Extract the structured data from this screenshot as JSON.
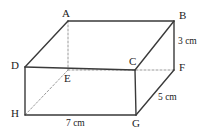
{
  "figure": {
    "name": "cuboid-diagram",
    "type": "geometry-solid",
    "solid": "cuboid",
    "background_color": "#ffffff",
    "edge_color": "#3a3a3a",
    "hidden_edge_color": "#9a9a9a",
    "label_color": "#222222",
    "vertices": [
      {
        "id": "A",
        "label": "A",
        "x": 68,
        "y": 21,
        "label_x": 62,
        "label_y": 8,
        "hidden": false
      },
      {
        "id": "B",
        "label": "B",
        "x": 174,
        "y": 21,
        "label_x": 179,
        "label_y": 10,
        "hidden": false
      },
      {
        "id": "C",
        "label": "C",
        "x": 135,
        "y": 70,
        "label_x": 129,
        "label_y": 56,
        "hidden": false
      },
      {
        "id": "D",
        "label": "D",
        "x": 25,
        "y": 67,
        "label_x": 11,
        "label_y": 60,
        "hidden": false
      },
      {
        "id": "E",
        "label": "E",
        "x": 68,
        "y": 70,
        "label_x": 64,
        "label_y": 73,
        "hidden": true
      },
      {
        "id": "F",
        "label": "F",
        "x": 174,
        "y": 70,
        "label_x": 179,
        "label_y": 62,
        "hidden": false
      },
      {
        "id": "G",
        "label": "G",
        "x": 136,
        "y": 115,
        "label_x": 132,
        "label_y": 118,
        "hidden": false
      },
      {
        "id": "H",
        "label": "H",
        "x": 25,
        "y": 115,
        "label_x": 11,
        "label_y": 108,
        "hidden": false
      }
    ],
    "solid_edges": [
      {
        "name": "edge-AB",
        "from": "A",
        "to": "B"
      },
      {
        "name": "edge-AD",
        "from": "A",
        "to": "D"
      },
      {
        "name": "edge-BC",
        "from": "B",
        "to": "C"
      },
      {
        "name": "edge-BF",
        "from": "B",
        "to": "F"
      },
      {
        "name": "edge-CD",
        "from": "C",
        "to": "D"
      },
      {
        "name": "edge-CG",
        "from": "C",
        "to": "G"
      },
      {
        "name": "edge-DH",
        "from": "D",
        "to": "H"
      },
      {
        "name": "edge-FG",
        "from": "F",
        "to": "G"
      },
      {
        "name": "edge-HG",
        "from": "H",
        "to": "G"
      }
    ],
    "hidden_edges": [
      {
        "name": "edge-AE",
        "from": "A",
        "to": "E"
      },
      {
        "name": "edge-EF",
        "from": "E",
        "to": "F"
      },
      {
        "name": "edge-EH",
        "from": "E",
        "to": "H"
      }
    ],
    "dimensions": [
      {
        "name": "dimension-height",
        "text": "3 cm",
        "value": 3,
        "unit": "cm",
        "edge": "BF",
        "x": 178,
        "y": 36
      },
      {
        "name": "dimension-depth",
        "text": "5 cm",
        "value": 5,
        "unit": "cm",
        "edge": "FG",
        "x": 158,
        "y": 92
      },
      {
        "name": "dimension-width",
        "text": "7 cm",
        "value": 7,
        "unit": "cm",
        "edge": "HG",
        "x": 66,
        "y": 118
      }
    ]
  }
}
